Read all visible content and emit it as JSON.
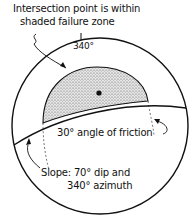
{
  "annotations": {
    "intersection_line1": "Intersection point is within",
    "intersection_line2": "shaded failure zone",
    "azimuth_tick": "340°",
    "friction": "30° angle of friction",
    "slope_line1": "Slope: 70° dip and",
    "slope_line2": "340° azimuth"
  },
  "colors": {
    "ink": "#111111",
    "shade": "#c8c8c8",
    "background": "#ffffff"
  }
}
